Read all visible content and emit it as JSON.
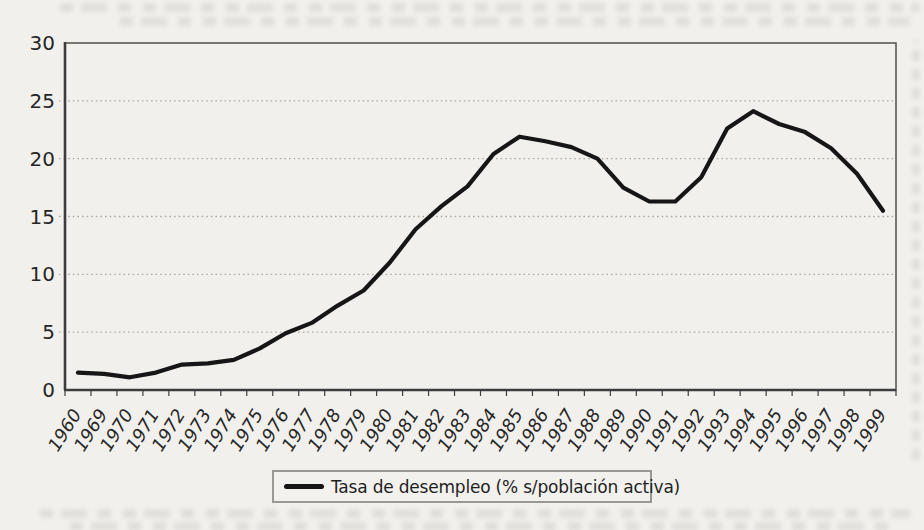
{
  "page": {
    "background_color": "#f1f0ec"
  },
  "chart_data": {
    "type": "line",
    "title": "",
    "xlabel": "",
    "ylabel": "",
    "legend_position": "bottom",
    "legend_label": "Tasa de desempleo (% s/población activa)",
    "grid": "horizontal dotted",
    "ylim": [
      0,
      30
    ],
    "yticks": [
      0,
      5,
      10,
      15,
      20,
      25,
      30
    ],
    "categories": [
      "1960",
      "1969",
      "1970",
      "1971",
      "1972",
      "1973",
      "1974",
      "1975",
      "1976",
      "1977",
      "1978",
      "1979",
      "1980",
      "1981",
      "1982",
      "1983",
      "1984",
      "1985",
      "1986",
      "1987",
      "1988",
      "1989",
      "1990",
      "1991",
      "1992",
      "1993",
      "1994",
      "1995",
      "1996",
      "1997",
      "1998",
      "1999"
    ],
    "series": [
      {
        "name": "Tasa de desempleo (% s/población activa)",
        "values": [
          1.5,
          1.4,
          1.1,
          1.5,
          2.2,
          2.3,
          2.6,
          3.6,
          4.9,
          5.8,
          7.3,
          8.6,
          11.0,
          13.9,
          15.9,
          17.6,
          20.4,
          21.9,
          21.5,
          21.0,
          20.0,
          17.5,
          16.3,
          16.3,
          18.4,
          22.6,
          24.1,
          23.0,
          22.3,
          20.9,
          18.7,
          15.5
        ]
      }
    ],
    "colors": {
      "line": "#161616",
      "axis": "#3d3d3d",
      "plot_border": "#5a5a56",
      "gridline": "#adaba4",
      "tick_text": "#262626",
      "legend_border": "#9a9892"
    }
  }
}
